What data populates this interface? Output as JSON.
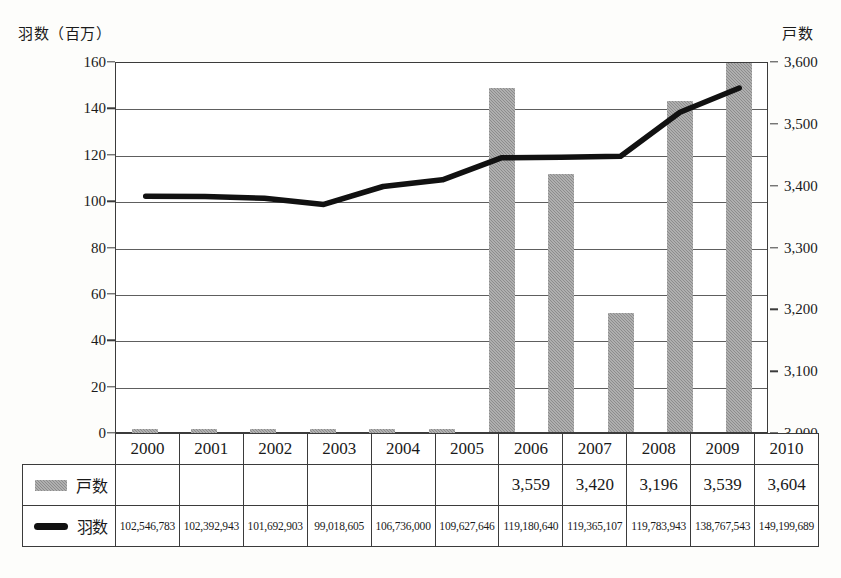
{
  "chart_data": {
    "type": "bar",
    "title": "",
    "subtitle": "",
    "xlabel": "",
    "categories": [
      "2000",
      "2001",
      "2002",
      "2003",
      "2004",
      "2005",
      "2006",
      "2007",
      "2008",
      "2009",
      "2010"
    ],
    "grid": true,
    "legend_position": "table-below",
    "axes": {
      "left": {
        "label": "羽数（百万）",
        "unit": "百万羽",
        "ticks": [
          0,
          20,
          40,
          60,
          80,
          100,
          120,
          140,
          160
        ],
        "tick_labels": [
          "0",
          "20",
          "40",
          "60",
          "80",
          "100",
          "120",
          "140",
          "160"
        ],
        "min": 0,
        "max": 160
      },
      "right": {
        "label": "戸数",
        "unit": "戸",
        "ticks": [
          3000,
          3100,
          3200,
          3300,
          3400,
          3500,
          3600
        ],
        "tick_labels": [
          "3,000",
          "3,100",
          "3,200",
          "3,300",
          "3,400",
          "3,500",
          "3,600"
        ],
        "min": 3000,
        "max": 3600
      }
    },
    "series": [
      {
        "name": "戸数",
        "type": "bar",
        "axis": "right",
        "color": "#8c8c8c",
        "values": [
          null,
          null,
          null,
          null,
          null,
          null,
          3559,
          3420,
          3196,
          3539,
          3604
        ],
        "value_labels": [
          "",
          "",
          "",
          "",
          "",
          "",
          "3,559",
          "3,420",
          "3,196",
          "3,539",
          "3,604"
        ]
      },
      {
        "name": "羽数",
        "type": "line",
        "axis": "left",
        "color": "#111111",
        "values": [
          102546783,
          102392943,
          101692903,
          99018605,
          106736000,
          109627646,
          119180640,
          119365107,
          119783943,
          138767543,
          149199689
        ],
        "values_millions": [
          102.55,
          102.39,
          101.69,
          99.02,
          106.74,
          109.63,
          119.18,
          119.37,
          119.78,
          138.77,
          149.2
        ],
        "value_labels": [
          "102,546,783",
          "102,392,943",
          "101,692,903",
          "99,018,605",
          "106,736,000",
          "109,627,646",
          "119,180,640",
          "119,365,107",
          "119,783,943",
          "138,767,543",
          "149,199,689"
        ]
      }
    ]
  },
  "table": {
    "year_header": [
      "2000",
      "2001",
      "2002",
      "2003",
      "2004",
      "2005",
      "2006",
      "2007",
      "2008",
      "2009",
      "2010"
    ],
    "rows": [
      {
        "legend_label": "戸数",
        "swatch": "bar-swatch-icon",
        "cells": [
          "",
          "",
          "",
          "",
          "",
          "",
          "3,559",
          "3,420",
          "3,196",
          "3,539",
          "3,604"
        ]
      },
      {
        "legend_label": "羽数",
        "swatch": "line-swatch-icon",
        "cells": [
          "102,546,783",
          "102,392,943",
          "101,692,903",
          "99,018,605",
          "106,736,000",
          "109,627,646",
          "119,180,640",
          "119,365,107",
          "119,783,943",
          "138,767,543",
          "149,199,689"
        ]
      }
    ]
  },
  "colors": {
    "bar": "#8c8c8c",
    "line": "#111111",
    "grid": "#5e5e5e",
    "frame": "#3b3b3b",
    "background": "#fdfdfb"
  }
}
